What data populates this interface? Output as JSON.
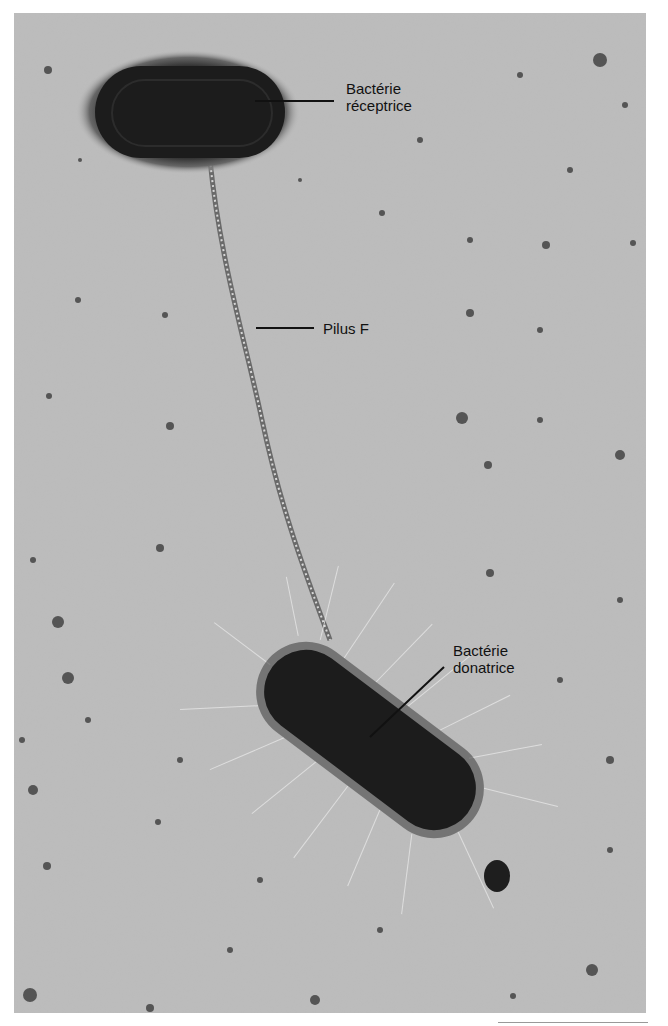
{
  "figure": {
    "type": "electron micrograph",
    "background_color": "#b9b9b9",
    "labels": [
      {
        "id": "receptor",
        "text": "Bactérie\nréceptrice"
      },
      {
        "id": "pilus",
        "text": "Pilus F"
      },
      {
        "id": "donor",
        "text": "Bactérie\ndonatrice"
      }
    ],
    "scale_bar": {
      "visible": true,
      "text": ""
    }
  }
}
